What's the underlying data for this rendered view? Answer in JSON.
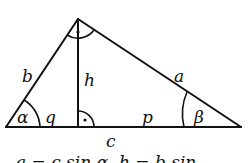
{
  "diagram": {
    "sides": {
      "a": "a",
      "b": "b",
      "c": "c"
    },
    "altitude": "h",
    "segments": {
      "q": "q",
      "p": "p"
    },
    "angles": {
      "alpha": "α",
      "beta": "β"
    },
    "right_angle_marks": [
      "top-vertex",
      "altitude-foot"
    ],
    "formula_line": "a = c sin α,   h = b sin"
  }
}
